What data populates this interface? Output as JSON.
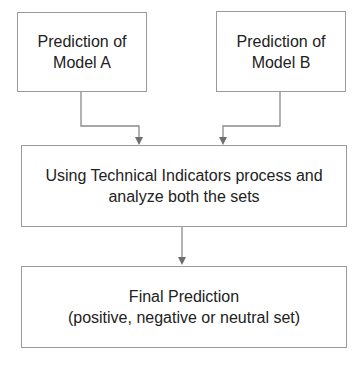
{
  "diagram": {
    "type": "flowchart",
    "colors": {
      "border": "#9a9a9a",
      "connector": "#7a7a7a",
      "text": "#222222",
      "background": "#ffffff"
    },
    "nodes": [
      {
        "id": "model-a",
        "lines": [
          "Prediction of",
          "Model A"
        ]
      },
      {
        "id": "model-b",
        "lines": [
          "Prediction of",
          "Model B"
        ]
      },
      {
        "id": "process",
        "lines": [
          "Using Technical Indicators process and",
          "analyze both the sets"
        ]
      },
      {
        "id": "final",
        "lines": [
          "Final Prediction",
          "(positive, negative or neutral set)"
        ]
      }
    ],
    "edges": [
      {
        "from": "model-a",
        "to": "process"
      },
      {
        "from": "model-b",
        "to": "process"
      },
      {
        "from": "process",
        "to": "final"
      }
    ]
  }
}
